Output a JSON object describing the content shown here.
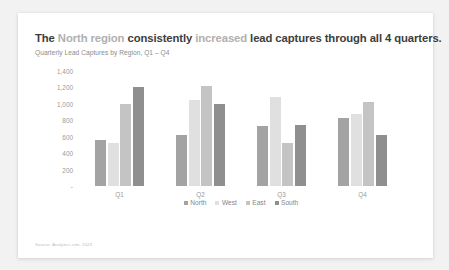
{
  "card": {
    "title_parts": [
      {
        "text": "The ",
        "muted": false
      },
      {
        "text": "North region ",
        "muted": true
      },
      {
        "text": "consistently ",
        "muted": false
      },
      {
        "text": "increased ",
        "muted": true
      },
      {
        "text": "lead captures through all 4 quarters.",
        "muted": false
      }
    ],
    "subtitle": "Quarterly Lead Captures by Region, Q1 – Q4",
    "source": "Source: Analytics.crm, 2023"
  },
  "chart_data": {
    "type": "bar",
    "title": "The North region consistently increased lead captures through all 4 quarters.",
    "subtitle": "Quarterly Lead Captures by Region, Q1 – Q4",
    "xlabel": "",
    "ylabel": "",
    "categories": [
      "Q1",
      "Q2",
      "Q3",
      "Q4"
    ],
    "ylim": [
      0,
      1400
    ],
    "yticks": [
      "-",
      "200",
      "400",
      "600",
      "800",
      "1,000",
      "1,200",
      "1,400"
    ],
    "ytick_values": [
      0,
      200,
      400,
      600,
      800,
      1000,
      1200,
      1400
    ],
    "grid": false,
    "legend_position": "bottom",
    "series": [
      {
        "name": "North",
        "color": "#a3a3a3",
        "values": [
          560,
          620,
          730,
          830
        ]
      },
      {
        "name": "West",
        "color": "#e0e0e0",
        "values": [
          520,
          1050,
          1080,
          880
        ]
      },
      {
        "name": "East",
        "color": "#c4c4c4",
        "values": [
          1000,
          1220,
          520,
          1020
        ]
      },
      {
        "name": "South",
        "color": "#8f8f8f",
        "values": [
          1200,
          1000,
          740,
          620
        ]
      }
    ]
  }
}
